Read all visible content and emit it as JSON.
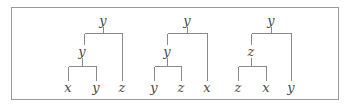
{
  "colors": {
    "line": "#8a8a8a",
    "text": "#4a4a4a",
    "border": "#9a9a9a"
  },
  "trees": [
    {
      "root": {
        "label": "y",
        "x": 103,
        "y": 21
      },
      "top_bar": {
        "y": 33,
        "x1": 84,
        "x2": 122
      },
      "inner": {
        "label": "y",
        "x": 84,
        "y": 52
      },
      "inner_bar": {
        "y": 66,
        "x1": 68,
        "x2": 96
      },
      "leaves": [
        {
          "label": "x",
          "x": 68
        },
        {
          "label": "y",
          "x": 96
        },
        {
          "label": "z",
          "x": 122
        }
      ]
    },
    {
      "root": {
        "label": "y",
        "x": 187,
        "y": 21
      },
      "top_bar": {
        "y": 33,
        "x1": 167,
        "x2": 207
      },
      "inner": {
        "label": "y",
        "x": 167,
        "y": 52
      },
      "inner_bar": {
        "y": 66,
        "x1": 154,
        "x2": 181
      },
      "leaves": [
        {
          "label": "y",
          "x": 154
        },
        {
          "label": "z",
          "x": 181
        },
        {
          "label": "x",
          "x": 207
        }
      ]
    },
    {
      "root": {
        "label": "y",
        "x": 271,
        "y": 21
      },
      "top_bar": {
        "y": 33,
        "x1": 251,
        "x2": 291
      },
      "inner": {
        "label": "z",
        "x": 251,
        "y": 52
      },
      "inner_bar": {
        "y": 66,
        "x1": 238,
        "x2": 266
      },
      "leaves": [
        {
          "label": "z",
          "x": 238
        },
        {
          "label": "x",
          "x": 266
        },
        {
          "label": "y",
          "x": 291
        }
      ]
    }
  ],
  "leaf_y": 88
}
